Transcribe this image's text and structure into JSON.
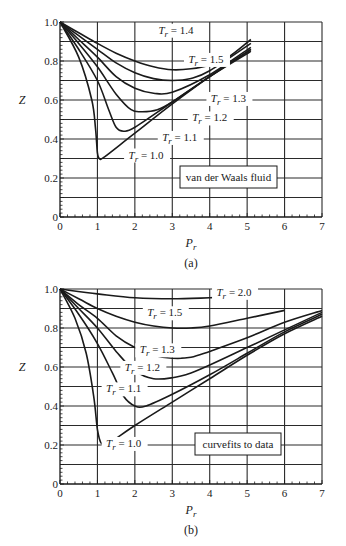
{
  "figure": {
    "panels": [
      {
        "id": "a",
        "caption": "(a)",
        "box_label": "van der Waals fluid"
      },
      {
        "id": "b",
        "caption": "(b)",
        "box_label": "curvefits to data"
      }
    ]
  },
  "chart_data": [
    {
      "type": "line",
      "title": "",
      "panel": "(a)",
      "xlabel": "P_r",
      "ylabel": "Z",
      "xlim": [
        0,
        7
      ],
      "ylim": [
        0,
        1.0
      ],
      "xticks": [
        0,
        1,
        2,
        3,
        4,
        5,
        6,
        7
      ],
      "yticks": [
        0,
        0.2,
        0.4,
        0.6,
        0.8,
        1.0
      ],
      "ytick_labels": [
        "0",
        "0.2",
        "0.4",
        "0.6",
        "0.8",
        "1.0"
      ],
      "grid": true,
      "annotation_box": "van der Waals fluid",
      "series": [
        {
          "name": "T_r = 1.0",
          "points": [
            [
              0,
              1.0
            ],
            [
              0.5,
              0.82
            ],
            [
              0.85,
              0.6
            ],
            [
              0.95,
              0.45
            ],
            [
              1.0,
              0.33
            ],
            [
              1.05,
              0.3
            ],
            [
              1.2,
              0.31
            ],
            [
              2.0,
              0.43
            ],
            [
              3.0,
              0.58
            ],
            [
              4.0,
              0.72
            ],
            [
              5.1,
              0.86
            ]
          ]
        },
        {
          "name": "T_r = 1.1",
          "points": [
            [
              0,
              1.0
            ],
            [
              0.5,
              0.86
            ],
            [
              1.0,
              0.7
            ],
            [
              1.3,
              0.55
            ],
            [
              1.5,
              0.46
            ],
            [
              1.7,
              0.44
            ],
            [
              2.0,
              0.46
            ],
            [
              3.0,
              0.59
            ],
            [
              4.0,
              0.72
            ],
            [
              5.1,
              0.85
            ]
          ]
        },
        {
          "name": "T_r = 1.2",
          "points": [
            [
              0,
              1.0
            ],
            [
              0.5,
              0.89
            ],
            [
              1.0,
              0.77
            ],
            [
              1.5,
              0.63
            ],
            [
              1.9,
              0.55
            ],
            [
              2.2,
              0.54
            ],
            [
              2.6,
              0.55
            ],
            [
              3.0,
              0.59
            ],
            [
              4.0,
              0.72
            ],
            [
              5.1,
              0.86
            ]
          ]
        },
        {
          "name": "T_r = 1.3",
          "points": [
            [
              0,
              1.0
            ],
            [
              0.5,
              0.91
            ],
            [
              1.0,
              0.82
            ],
            [
              1.5,
              0.72
            ],
            [
              2.0,
              0.66
            ],
            [
              2.5,
              0.635
            ],
            [
              3.0,
              0.64
            ],
            [
              4.0,
              0.73
            ],
            [
              5.1,
              0.87
            ]
          ]
        },
        {
          "name": "T_r = 1.4",
          "points": [
            [
              0,
              1.0
            ],
            [
              0.5,
              0.93
            ],
            [
              1.0,
              0.86
            ],
            [
              1.5,
              0.79
            ],
            [
              2.0,
              0.74
            ],
            [
              2.5,
              0.71
            ],
            [
              3.0,
              0.7
            ],
            [
              3.5,
              0.71
            ],
            [
              4.0,
              0.75
            ],
            [
              5.1,
              0.89
            ]
          ]
        },
        {
          "name": "T_r = 1.5",
          "points": [
            [
              0,
              1.0
            ],
            [
              0.5,
              0.945
            ],
            [
              1.0,
              0.89
            ],
            [
              1.5,
              0.84
            ],
            [
              2.0,
              0.8
            ],
            [
              2.5,
              0.77
            ],
            [
              3.0,
              0.755
            ],
            [
              3.5,
              0.76
            ],
            [
              4.0,
              0.78
            ],
            [
              4.5,
              0.82
            ],
            [
              5.1,
              0.91
            ]
          ]
        }
      ],
      "labels": [
        {
          "text": "T_r = 1.4",
          "at": [
            3.1,
            0.94
          ]
        },
        {
          "text": "T_r = 1.5",
          "at": [
            3.9,
            0.79
          ]
        },
        {
          "text": "T_r = 1.3",
          "at": [
            4.5,
            0.59
          ]
        },
        {
          "text": "T_r = 1.2",
          "at": [
            4.0,
            0.49
          ]
        },
        {
          "text": "T_r = 1.1",
          "at": [
            3.2,
            0.39
          ]
        },
        {
          "text": "T_r = 1.0",
          "at": [
            2.3,
            0.3
          ]
        }
      ]
    },
    {
      "type": "line",
      "title": "",
      "panel": "(b)",
      "xlabel": "P_r",
      "ylabel": "Z",
      "xlim": [
        0,
        7
      ],
      "ylim": [
        0,
        1.0
      ],
      "xticks": [
        0,
        1,
        2,
        3,
        4,
        5,
        6,
        7
      ],
      "yticks": [
        0,
        0.2,
        0.4,
        0.6,
        0.8,
        1.0
      ],
      "ytick_labels": [
        "0",
        "0.2",
        "0.4",
        "0.6",
        "0.8",
        "1.0"
      ],
      "grid": true,
      "annotation_box": "curvefits to data",
      "series": [
        {
          "name": "T_r = 1.0",
          "points": [
            [
              0,
              1.0
            ],
            [
              0.4,
              0.85
            ],
            [
              0.7,
              0.67
            ],
            [
              0.9,
              0.45
            ],
            [
              1.0,
              0.28
            ],
            [
              1.1,
              0.21
            ],
            [
              1.3,
              0.21
            ],
            [
              2.0,
              0.3
            ],
            [
              3.0,
              0.42
            ],
            [
              4.0,
              0.54
            ],
            [
              5.0,
              0.66
            ],
            [
              6.0,
              0.77
            ],
            [
              7.0,
              0.86
            ]
          ]
        },
        {
          "name": "T_r = 1.1",
          "points": [
            [
              0,
              1.0
            ],
            [
              0.5,
              0.87
            ],
            [
              1.0,
              0.72
            ],
            [
              1.4,
              0.57
            ],
            [
              1.7,
              0.45
            ],
            [
              2.0,
              0.4
            ],
            [
              2.3,
              0.4
            ],
            [
              3.0,
              0.46
            ],
            [
              4.0,
              0.56
            ],
            [
              5.0,
              0.67
            ],
            [
              6.0,
              0.78
            ],
            [
              7.0,
              0.87
            ]
          ]
        },
        {
          "name": "T_r = 1.2",
          "points": [
            [
              0,
              1.0
            ],
            [
              0.5,
              0.9
            ],
            [
              1.0,
              0.8
            ],
            [
              1.5,
              0.68
            ],
            [
              2.0,
              0.58
            ],
            [
              2.5,
              0.54
            ],
            [
              3.0,
              0.545
            ],
            [
              3.5,
              0.57
            ],
            [
              4.0,
              0.61
            ],
            [
              5.0,
              0.7
            ],
            [
              6.0,
              0.79
            ],
            [
              7.0,
              0.88
            ]
          ]
        },
        {
          "name": "T_r = 1.3",
          "points": [
            [
              0,
              1.0
            ],
            [
              0.5,
              0.92
            ],
            [
              1.0,
              0.85
            ],
            [
              1.5,
              0.76
            ],
            [
              2.0,
              0.7
            ],
            [
              2.5,
              0.66
            ],
            [
              3.0,
              0.645
            ],
            [
              3.5,
              0.65
            ],
            [
              4.0,
              0.68
            ],
            [
              5.0,
              0.75
            ],
            [
              6.0,
              0.83
            ],
            [
              7.0,
              0.89
            ]
          ]
        },
        {
          "name": "T_r = 1.5",
          "points": [
            [
              0,
              1.0
            ],
            [
              0.5,
              0.95
            ],
            [
              1.0,
              0.9
            ],
            [
              1.5,
              0.86
            ],
            [
              2.0,
              0.83
            ],
            [
              2.5,
              0.81
            ],
            [
              3.0,
              0.8
            ],
            [
              3.5,
              0.8
            ],
            [
              4.0,
              0.81
            ],
            [
              5.0,
              0.85
            ],
            [
              6.0,
              0.89
            ]
          ]
        },
        {
          "name": "T_r = 2.0",
          "points": [
            [
              0,
              1.0
            ],
            [
              1.0,
              0.975
            ],
            [
              2.0,
              0.955
            ],
            [
              3.0,
              0.95
            ],
            [
              4.0,
              0.955
            ],
            [
              4.6,
              0.96
            ]
          ]
        }
      ],
      "labels": [
        {
          "text": "T_r = 2.0",
          "at": [
            4.65,
            0.965
          ]
        },
        {
          "text": "T_r = 1.5",
          "at": [
            2.8,
            0.86
          ]
        },
        {
          "text": "T_r = 1.3",
          "at": [
            2.6,
            0.67
          ]
        },
        {
          "text": "T_r = 1.2",
          "at": [
            2.2,
            0.58
          ]
        },
        {
          "text": "T_r = 1.1",
          "at": [
            1.7,
            0.47
          ]
        },
        {
          "text": "T_r = 1.0",
          "at": [
            1.7,
            0.19
          ]
        }
      ]
    }
  ]
}
